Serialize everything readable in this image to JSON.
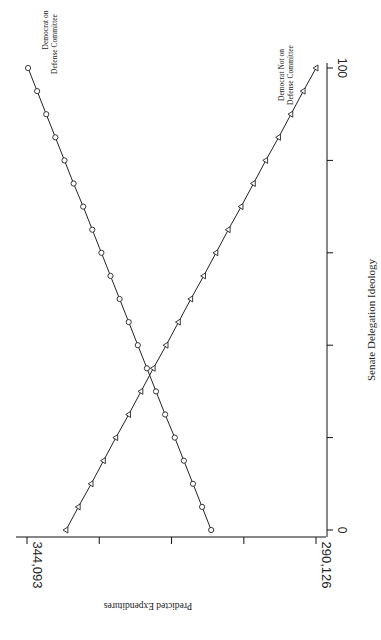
{
  "chart_data": {
    "type": "line",
    "orientation": "rotated-90-clockwise",
    "title": "",
    "xlabel": "Senate Delegation Ideology",
    "ylabel": "Predicted Expenditures",
    "xlim": [
      0,
      100
    ],
    "ylim": [
      290.126,
      344.093
    ],
    "x_tick_labels": [
      "0",
      "100"
    ],
    "x_ticks": [
      0,
      20,
      40,
      60,
      80,
      100
    ],
    "y_tick_labels": [
      "344,093",
      "290,126"
    ],
    "y_ticks": [
      344.093,
      330.6,
      317.1,
      303.6,
      290.126
    ],
    "x": [
      0,
      5,
      10,
      15,
      20,
      25,
      30,
      35,
      40,
      45,
      50,
      55,
      60,
      65,
      70,
      75,
      80,
      85,
      90,
      95,
      100
    ],
    "series": [
      {
        "name": "Democrat on Defense Committee",
        "marker": "circle",
        "values": [
          309.7,
          311.4,
          313.1,
          314.8,
          316.5,
          318.3,
          320.0,
          321.7,
          323.4,
          325.1,
          326.8,
          328.5,
          330.2,
          331.9,
          333.6,
          335.4,
          337.1,
          338.8,
          340.5,
          342.2,
          343.9
        ]
      },
      {
        "name": "Democrat Not on Defense Committee",
        "marker": "triangle",
        "values": [
          336.8,
          334.5,
          332.1,
          329.8,
          327.5,
          325.1,
          322.8,
          320.5,
          318.1,
          315.8,
          313.5,
          311.1,
          308.8,
          306.5,
          304.1,
          301.8,
          299.5,
          297.1,
          294.8,
          292.5,
          290.1
        ]
      }
    ],
    "annotations": [
      {
        "series": 0,
        "lines": [
          "Democrat on",
          "Defense Committee"
        ]
      },
      {
        "series": 1,
        "lines": [
          "Democrat Not on",
          "Defense Committee"
        ]
      }
    ],
    "grid": false,
    "legend": "none (direct labels)"
  },
  "labels": {
    "x_axis_title": "Senate Delegation Ideology",
    "y_axis_title": "Predicted Expenditures",
    "x_tick_min": "0",
    "x_tick_max": "100",
    "y_tick_max": "344,093",
    "y_tick_min": "290,126",
    "annot_on_1": "Democrat on",
    "annot_on_2": "Defense Committee",
    "annot_not_1": "Democrat Not on",
    "annot_not_2": "Defense Committee"
  }
}
